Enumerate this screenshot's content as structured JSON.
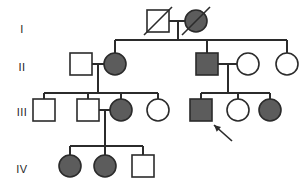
{
  "figure": {
    "type": "pedigree",
    "width": 306,
    "height": 187,
    "background_color": "#ffffff",
    "line_color": "#2b2b2b",
    "affected_fill": "#5c5c5c",
    "unaffected_fill": "#ffffff",
    "symbol_stroke": "#2b2b2b",
    "legend_implied": {
      "square": "male",
      "circle": "female",
      "filled": "affected",
      "open": "unaffected",
      "slash": "deceased",
      "arrow": "proband"
    }
  },
  "generations": [
    {
      "id": "gen-1",
      "label": "I",
      "label_x": 22,
      "label_y": 30
    },
    {
      "id": "gen-2",
      "label": "II",
      "label_x": 22,
      "label_y": 68
    },
    {
      "id": "gen-3",
      "label": "III",
      "label_x": 22,
      "label_y": 113
    },
    {
      "id": "gen-4",
      "label": "IV",
      "label_x": 22,
      "label_y": 170
    }
  ],
  "individuals": [
    {
      "id": "I-1",
      "generation": "I",
      "sex": "male",
      "affected": false,
      "deceased": true,
      "proband": false,
      "shape": "square",
      "cx": 158,
      "cy": 21,
      "size": 22
    },
    {
      "id": "I-2",
      "generation": "I",
      "sex": "female",
      "affected": true,
      "deceased": true,
      "proband": false,
      "shape": "circle",
      "cx": 196,
      "cy": 21,
      "r": 11
    },
    {
      "id": "II-1",
      "generation": "II",
      "sex": "male",
      "affected": false,
      "deceased": false,
      "proband": false,
      "shape": "square",
      "cx": 81,
      "cy": 64,
      "size": 22
    },
    {
      "id": "II-2",
      "generation": "II",
      "sex": "female",
      "affected": true,
      "deceased": false,
      "proband": false,
      "shape": "circle",
      "cx": 115,
      "cy": 64,
      "r": 11
    },
    {
      "id": "II-3",
      "generation": "II",
      "sex": "male",
      "affected": true,
      "deceased": false,
      "proband": false,
      "shape": "square",
      "cx": 207,
      "cy": 64,
      "size": 22
    },
    {
      "id": "II-4",
      "generation": "II",
      "sex": "female",
      "affected": false,
      "deceased": false,
      "proband": false,
      "shape": "circle",
      "cx": 248,
      "cy": 64,
      "r": 11
    },
    {
      "id": "II-5",
      "generation": "II",
      "sex": "female",
      "affected": false,
      "deceased": false,
      "proband": false,
      "shape": "circle",
      "cx": 287,
      "cy": 64,
      "r": 11
    },
    {
      "id": "III-1",
      "generation": "III",
      "sex": "male",
      "affected": false,
      "deceased": false,
      "proband": false,
      "shape": "square",
      "cx": 44,
      "cy": 110,
      "size": 22
    },
    {
      "id": "III-2",
      "generation": "III",
      "sex": "male",
      "affected": false,
      "deceased": false,
      "proband": false,
      "shape": "square",
      "cx": 88,
      "cy": 110,
      "size": 22
    },
    {
      "id": "III-3",
      "generation": "III",
      "sex": "female",
      "affected": true,
      "deceased": false,
      "proband": false,
      "shape": "circle",
      "cx": 121,
      "cy": 110,
      "r": 11
    },
    {
      "id": "III-4",
      "generation": "III",
      "sex": "female",
      "affected": false,
      "deceased": false,
      "proband": false,
      "shape": "circle",
      "cx": 158,
      "cy": 110,
      "r": 11
    },
    {
      "id": "III-5",
      "generation": "III",
      "sex": "male",
      "affected": true,
      "deceased": false,
      "proband": true,
      "shape": "square",
      "cx": 201,
      "cy": 110,
      "size": 22
    },
    {
      "id": "III-6",
      "generation": "III",
      "sex": "female",
      "affected": false,
      "deceased": false,
      "proband": false,
      "shape": "circle",
      "cx": 238,
      "cy": 110,
      "r": 11
    },
    {
      "id": "III-7",
      "generation": "III",
      "sex": "female",
      "affected": true,
      "deceased": false,
      "proband": false,
      "shape": "circle",
      "cx": 270,
      "cy": 110,
      "r": 11
    },
    {
      "id": "IV-1",
      "generation": "IV",
      "sex": "female",
      "affected": true,
      "deceased": false,
      "proband": false,
      "shape": "circle",
      "cx": 70,
      "cy": 166,
      "r": 11
    },
    {
      "id": "IV-2",
      "generation": "IV",
      "sex": "female",
      "affected": true,
      "deceased": false,
      "proband": false,
      "shape": "circle",
      "cx": 105,
      "cy": 166,
      "r": 11
    },
    {
      "id": "IV-3",
      "generation": "IV",
      "sex": "male",
      "affected": false,
      "deceased": false,
      "proband": false,
      "shape": "square",
      "cx": 143,
      "cy": 166,
      "size": 22
    }
  ],
  "matings": [
    {
      "id": "mating-I",
      "partners": [
        "I-1",
        "I-2"
      ],
      "line_y": 21,
      "x1": 169,
      "x2": 185,
      "drop_x": 178,
      "drop_to_y": 40
    },
    {
      "id": "mating-II-L",
      "partners": [
        "II-1",
        "II-2"
      ],
      "line_y": 64,
      "x1": 92,
      "x2": 104,
      "drop_x": 98,
      "drop_to_y": 93
    },
    {
      "id": "mating-II-R",
      "partners": [
        "II-3",
        "II-4"
      ],
      "line_y": 64,
      "x1": 218,
      "x2": 237,
      "drop_x": 228,
      "drop_to_y": 93
    },
    {
      "id": "mating-III",
      "partners": [
        "III-2",
        "III-3"
      ],
      "line_y": 110,
      "x1": 99,
      "x2": 110,
      "drop_x": 105,
      "drop_to_y": 146
    }
  ],
  "sibships": [
    {
      "id": "sibship-I",
      "parent_mating": "mating-I",
      "line_y": 40,
      "x1": 115,
      "x2": 287,
      "children_x": [
        115,
        207,
        287
      ],
      "child_top_y": 53
    },
    {
      "id": "sibship-II-L",
      "parent_mating": "mating-II-L",
      "line_y": 93,
      "x1": 44,
      "x2": 158,
      "children_x": [
        44,
        88,
        121,
        158
      ],
      "child_top_y": 99
    },
    {
      "id": "sibship-II-R",
      "parent_mating": "mating-II-R",
      "line_y": 93,
      "x1": 201,
      "x2": 270,
      "children_x": [
        201,
        238,
        270
      ],
      "child_top_y": 99
    },
    {
      "id": "sibship-III",
      "parent_mating": "mating-III",
      "line_y": 146,
      "x1": 70,
      "x2": 143,
      "children_x": [
        70,
        105,
        143
      ],
      "child_top_y": 155
    }
  ],
  "proband_arrow": {
    "target": "III-5",
    "tail_x": 232,
    "tail_y": 141,
    "head_x": 214,
    "head_y": 125
  }
}
